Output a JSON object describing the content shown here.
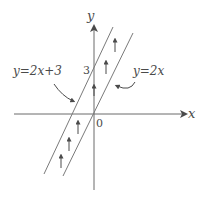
{
  "diagram": {
    "axes": {
      "x_label": "x",
      "y_label": "y",
      "origin_label": "0",
      "y_intercept_label": "3"
    },
    "lines": [
      {
        "id": "line-y-2x-plus-3",
        "label": "y=2x+3",
        "slope": 2,
        "intercept": 3
      },
      {
        "id": "line-y-2x",
        "label": "y=2x",
        "slope": 2,
        "intercept": 0
      }
    ],
    "shift_arrows": {
      "count": 6,
      "direction": "up"
    },
    "colors": {
      "stroke": "#6e6e6e",
      "axis": "#5a5a5a",
      "text": "#4a4a4a"
    }
  }
}
